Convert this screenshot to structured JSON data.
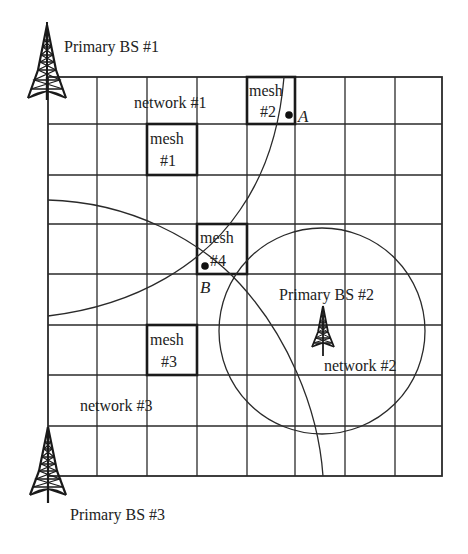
{
  "diagram": {
    "type": "cognitive radio mesh network layout",
    "grid": {
      "x_lines": [
        48,
        97,
        147,
        197,
        247,
        295,
        345,
        395,
        442
      ],
      "y_lines": [
        77,
        124,
        175,
        224,
        274,
        325,
        375,
        426,
        476
      ],
      "line_color": "#2a2a2a"
    },
    "base_stations": [
      {
        "id": "bs1",
        "label": "Primary BS #1",
        "tower": {
          "x": 47,
          "tip_y": 25,
          "base_y": 100,
          "half_width": 20
        }
      },
      {
        "id": "bs2",
        "label": "Primary BS #2",
        "tower": {
          "x": 323,
          "tip_y": 306,
          "base_y": 347,
          "half_width": 12
        }
      },
      {
        "id": "bs3",
        "label": "Primary BS #3",
        "tower": {
          "x": 48,
          "tip_y": 427,
          "base_y": 495,
          "half_width": 19
        }
      }
    ],
    "networks": [
      {
        "id": "net1",
        "label": "network #1"
      },
      {
        "id": "net2",
        "label": "network #2"
      },
      {
        "id": "net3",
        "label": "network #3"
      }
    ],
    "mesh_nodes": [
      {
        "id": "mesh1",
        "line1": "mesh",
        "line2": "#1"
      },
      {
        "id": "mesh2",
        "line1": "mesh",
        "line2": "#2"
      },
      {
        "id": "mesh3",
        "line1": "mesh",
        "line2": "#3"
      },
      {
        "id": "mesh4",
        "line1": "mesh",
        "line2": "#4"
      }
    ],
    "points": [
      {
        "id": "A",
        "label": "A"
      },
      {
        "id": "B",
        "label": "B"
      }
    ],
    "coverage": {
      "network2_circle": {
        "cx": 322,
        "cy": 331,
        "r": 103
      }
    }
  }
}
